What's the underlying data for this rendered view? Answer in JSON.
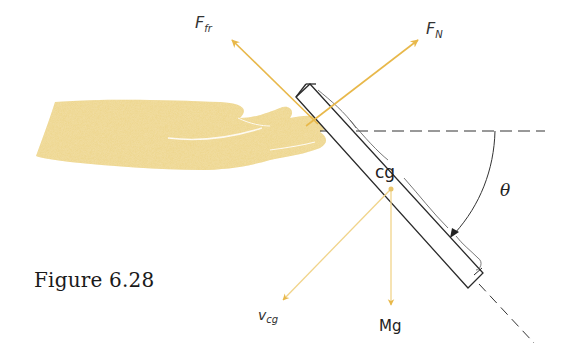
{
  "figure": {
    "caption": "Figure 6.28",
    "labels": {
      "friction_force_main": "F",
      "friction_force_sub": "fr",
      "normal_force_main": "F",
      "normal_force_sub": "N",
      "center_of_gravity": "cg",
      "velocity_main": "v",
      "velocity_sub": "cg",
      "weight": "Mg",
      "angle": "θ"
    },
    "colors": {
      "arrow": "#E8B84A",
      "arrow_light": "#F1D48A",
      "hand": "#EDD58A",
      "board_outline": "#2a2a2a",
      "dashed_line": "#333333"
    },
    "vectors": [
      {
        "name": "friction-force",
        "from": [
          318,
          124
        ],
        "to": [
          230,
          38
        ]
      },
      {
        "name": "normal-force",
        "from": [
          306,
          126
        ],
        "to": [
          420,
          38
        ]
      },
      {
        "name": "velocity-cg",
        "from": [
          391,
          189
        ],
        "to": [
          281,
          302
        ]
      },
      {
        "name": "weight",
        "from": [
          391,
          189
        ],
        "to": [
          391,
          307
        ]
      }
    ]
  }
}
